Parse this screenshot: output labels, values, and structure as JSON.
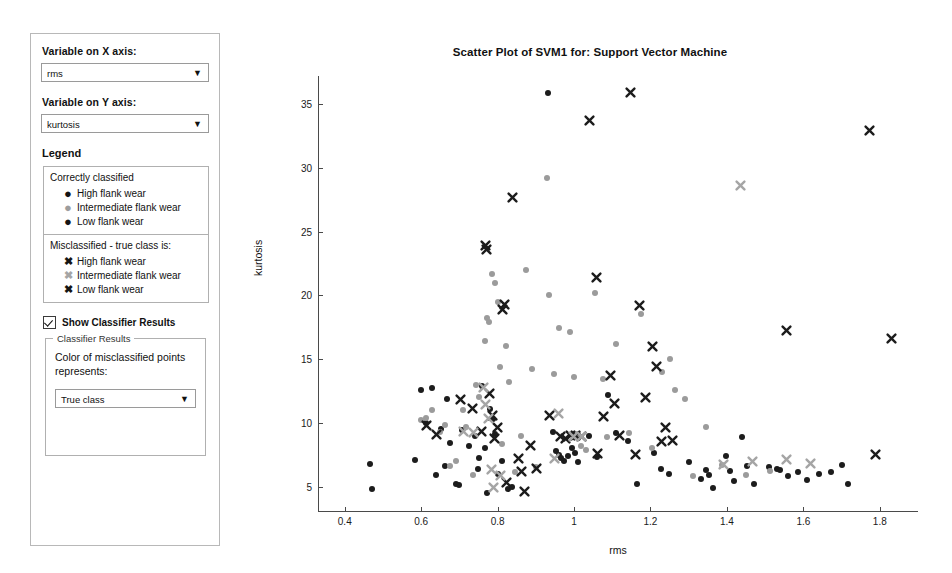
{
  "panel": {
    "x_axis_label": "Variable on X axis:",
    "x_axis_value": "rms",
    "y_axis_label": "Variable on Y axis:",
    "y_axis_value": "kurtosis",
    "legend_title": "Legend",
    "correct_heading": "Correctly classified",
    "correct_items": [
      {
        "marker": "dot-dark",
        "glyph": "●",
        "label": "High flank wear"
      },
      {
        "marker": "dot-gray",
        "glyph": "●",
        "label": "Intermediate flank wear"
      },
      {
        "marker": "dot-dark",
        "glyph": "●",
        "label": "Low flank wear"
      }
    ],
    "misclassified_heading": "Misclassified - true class is:",
    "misclassified_items": [
      {
        "marker": "x-dark",
        "glyph": "✖",
        "label": "High flank wear"
      },
      {
        "marker": "x-gray",
        "glyph": "✖",
        "label": "Intermediate flank wear"
      },
      {
        "marker": "x-dark",
        "glyph": "✖",
        "label": "Low flank wear"
      }
    ],
    "show_results_label": "Show Classifier Results",
    "show_results_checked": true,
    "group_legend": "Classifier Results",
    "group_text": "Color of misclassified points represents:",
    "color_select_value": "True class",
    "dropdown_arrow": "❯"
  },
  "chart_data": {
    "type": "scatter",
    "title": "Scatter Plot of SVM1 for: Support Vector Machine",
    "xlabel": "rms",
    "ylabel": "kurtosis",
    "xlim": [
      0.33,
      1.9
    ],
    "ylim": [
      3.0,
      37.2
    ],
    "xticks": [
      0.4,
      0.6,
      0.8,
      1,
      1.2,
      1.4,
      1.6,
      1.8
    ],
    "xticklabels": [
      "0.4",
      "0.6",
      "0.8",
      "1",
      "1.2",
      "1.4",
      "1.6",
      "1.8"
    ],
    "yticks": [
      5,
      10,
      15,
      20,
      25,
      30,
      35
    ],
    "yticklabels": [
      "5",
      "10",
      "15",
      "20",
      "25",
      "30",
      "35"
    ],
    "grid": false,
    "legend_position": "external-left-panel",
    "colors": {
      "dark": "#1c1c1c",
      "gray": "#9b9b9b"
    },
    "series": [
      {
        "name": "Correctly classified - dark",
        "marker": "dot",
        "color": "#1c1c1c",
        "points": [
          [
            0.465,
            6.8
          ],
          [
            0.47,
            4.8
          ],
          [
            0.585,
            7.1
          ],
          [
            0.6,
            12.6
          ],
          [
            0.612,
            10.0
          ],
          [
            0.627,
            12.7
          ],
          [
            0.64,
            5.9
          ],
          [
            0.651,
            9.5
          ],
          [
            0.662,
            6.6
          ],
          [
            0.667,
            11.9
          ],
          [
            0.676,
            8.4
          ],
          [
            0.69,
            5.2
          ],
          [
            0.7,
            5.1
          ],
          [
            0.706,
            9.4
          ],
          [
            0.724,
            8.2
          ],
          [
            0.742,
            9.0
          ],
          [
            0.748,
            6.4
          ],
          [
            0.752,
            7.2
          ],
          [
            0.76,
            12.9
          ],
          [
            0.768,
            8.0
          ],
          [
            0.772,
            4.5
          ],
          [
            0.781,
            11.1
          ],
          [
            0.789,
            10.3
          ],
          [
            0.793,
            9.1
          ],
          [
            0.8,
            6.0
          ],
          [
            0.812,
            7.0
          ],
          [
            0.826,
            4.8
          ],
          [
            0.838,
            5.0
          ],
          [
            0.931,
            35.9
          ],
          [
            0.944,
            9.3
          ],
          [
            0.952,
            7.8
          ],
          [
            0.96,
            7.5
          ],
          [
            0.966,
            7.2
          ],
          [
            0.974,
            7.0
          ],
          [
            0.985,
            7.4
          ],
          [
            0.995,
            8.0
          ],
          [
            1.002,
            7.6
          ],
          [
            1.01,
            6.9
          ],
          [
            1.04,
            9.0
          ],
          [
            1.06,
            7.3
          ],
          [
            1.09,
            12.2
          ],
          [
            1.11,
            9.2
          ],
          [
            1.14,
            8.6
          ],
          [
            1.165,
            5.2
          ],
          [
            1.21,
            7.6
          ],
          [
            1.228,
            6.4
          ],
          [
            1.248,
            6.0
          ],
          [
            1.3,
            6.9
          ],
          [
            1.333,
            5.6
          ],
          [
            1.345,
            6.3
          ],
          [
            1.352,
            5.9
          ],
          [
            1.363,
            4.9
          ],
          [
            1.398,
            7.4
          ],
          [
            1.408,
            6.2
          ],
          [
            1.418,
            5.4
          ],
          [
            1.44,
            8.9
          ],
          [
            1.452,
            6.6
          ],
          [
            1.47,
            5.2
          ],
          [
            1.51,
            6.5
          ],
          [
            1.532,
            6.4
          ],
          [
            1.54,
            6.3
          ],
          [
            1.56,
            5.8
          ],
          [
            1.585,
            6.1
          ],
          [
            1.61,
            5.5
          ],
          [
            1.64,
            6.0
          ],
          [
            1.672,
            6.1
          ],
          [
            1.7,
            6.7
          ],
          [
            1.718,
            5.2
          ]
        ]
      },
      {
        "name": "Correctly classified - intermediate (gray)",
        "marker": "dot",
        "color": "#9b9b9b",
        "points": [
          [
            0.6,
            10.2
          ],
          [
            0.613,
            10.4
          ],
          [
            0.628,
            11.0
          ],
          [
            0.648,
            9.3
          ],
          [
            0.662,
            9.8
          ],
          [
            0.676,
            6.6
          ],
          [
            0.69,
            7.0
          ],
          [
            0.71,
            11.0
          ],
          [
            0.717,
            9.7
          ],
          [
            0.735,
            5.9
          ],
          [
            0.744,
            13.0
          ],
          [
            0.752,
            12.0
          ],
          [
            0.766,
            16.4
          ],
          [
            0.772,
            18.2
          ],
          [
            0.778,
            17.9
          ],
          [
            0.786,
            21.7
          ],
          [
            0.792,
            21.0
          ],
          [
            0.8,
            19.5
          ],
          [
            0.805,
            14.4
          ],
          [
            0.812,
            8.3
          ],
          [
            0.822,
            16.0
          ],
          [
            0.83,
            13.2
          ],
          [
            0.845,
            6.1
          ],
          [
            0.862,
            9.0
          ],
          [
            0.875,
            22.0
          ],
          [
            0.89,
            14.2
          ],
          [
            0.9,
            6.5
          ],
          [
            0.928,
            29.2
          ],
          [
            0.935,
            20.0
          ],
          [
            0.948,
            13.8
          ],
          [
            0.96,
            17.4
          ],
          [
            0.99,
            17.1
          ],
          [
            1.0,
            13.6
          ],
          [
            1.01,
            9.1
          ],
          [
            1.018,
            8.2
          ],
          [
            1.03,
            7.9
          ],
          [
            1.055,
            20.2
          ],
          [
            1.075,
            13.4
          ],
          [
            1.085,
            8.9
          ],
          [
            1.11,
            16.2
          ],
          [
            1.145,
            9.2
          ],
          [
            1.175,
            18.5
          ],
          [
            1.205,
            8.0
          ],
          [
            1.23,
            14.0
          ],
          [
            1.25,
            15.0
          ],
          [
            1.265,
            12.6
          ],
          [
            1.29,
            11.9
          ],
          [
            1.31,
            5.8
          ],
          [
            1.345,
            9.7
          ],
          [
            1.386,
            6.7
          ],
          [
            1.45,
            5.9
          ],
          [
            1.512,
            6.2
          ]
        ]
      },
      {
        "name": "Misclassified - true class dark",
        "marker": "x",
        "color": "#1c1c1c",
        "points": [
          [
            0.615,
            9.8
          ],
          [
            0.64,
            9.1
          ],
          [
            0.702,
            11.8
          ],
          [
            0.735,
            11.1
          ],
          [
            0.758,
            9.3
          ],
          [
            0.768,
            23.9
          ],
          [
            0.772,
            23.6
          ],
          [
            0.78,
            12.3
          ],
          [
            0.786,
            10.6
          ],
          [
            0.792,
            8.8
          ],
          [
            0.8,
            9.6
          ],
          [
            0.812,
            18.9
          ],
          [
            0.818,
            19.3
          ],
          [
            0.822,
            5.3
          ],
          [
            0.838,
            27.7
          ],
          [
            0.855,
            7.2
          ],
          [
            0.862,
            6.2
          ],
          [
            0.87,
            4.6
          ],
          [
            0.885,
            8.2
          ],
          [
            0.902,
            6.4
          ],
          [
            0.935,
            10.6
          ],
          [
            0.965,
            8.9
          ],
          [
            0.978,
            8.8
          ],
          [
            0.99,
            9.0
          ],
          [
            1.005,
            9.0
          ],
          [
            1.02,
            8.9
          ],
          [
            1.04,
            33.7
          ],
          [
            1.058,
            21.4
          ],
          [
            1.062,
            7.6
          ],
          [
            1.078,
            10.5
          ],
          [
            1.095,
            13.7
          ],
          [
            1.105,
            11.5
          ],
          [
            1.12,
            9.0
          ],
          [
            1.148,
            35.9
          ],
          [
            1.16,
            7.5
          ],
          [
            1.17,
            19.2
          ],
          [
            1.188,
            12.0
          ],
          [
            1.205,
            16.0
          ],
          [
            1.215,
            14.4
          ],
          [
            1.228,
            8.5
          ],
          [
            1.238,
            9.6
          ],
          [
            1.258,
            8.6
          ],
          [
            1.555,
            17.2
          ],
          [
            1.772,
            32.9
          ],
          [
            1.83,
            16.6
          ],
          [
            1.788,
            7.5
          ]
        ]
      },
      {
        "name": "Misclassified - true class intermediate (gray)",
        "marker": "x",
        "color": "#a5a5a5",
        "points": [
          [
            0.712,
            9.3
          ],
          [
            0.736,
            9.2
          ],
          [
            0.762,
            12.8
          ],
          [
            0.768,
            11.4
          ],
          [
            0.776,
            10.3
          ],
          [
            0.784,
            6.3
          ],
          [
            0.79,
            4.9
          ],
          [
            0.808,
            5.9
          ],
          [
            0.95,
            7.2
          ],
          [
            0.958,
            10.7
          ],
          [
            0.998,
            8.9
          ],
          [
            1.02,
            8.9
          ],
          [
            1.435,
            28.6
          ],
          [
            1.392,
            6.7
          ],
          [
            1.468,
            7.0
          ],
          [
            1.555,
            7.1
          ],
          [
            1.62,
            6.8
          ]
        ]
      }
    ]
  }
}
